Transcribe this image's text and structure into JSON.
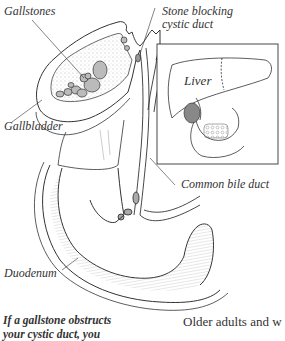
{
  "figure": {
    "labels": {
      "gallstones": "Gallstones",
      "stone_blocking_line1": "Stone blocking",
      "stone_blocking_line2": "cystic duct",
      "gallbladder": "Gallbladder",
      "liver": "Liver",
      "common_bile_duct": "Common bile duct",
      "duodenum": "Duodenum"
    }
  },
  "caption": {
    "line1": "If a gallstone obstructs",
    "line2": "your cystic duct, you"
  },
  "body": {
    "line1": "Older adults and w"
  },
  "colors": {
    "ink": "#333333",
    "background": "#ffffff"
  }
}
